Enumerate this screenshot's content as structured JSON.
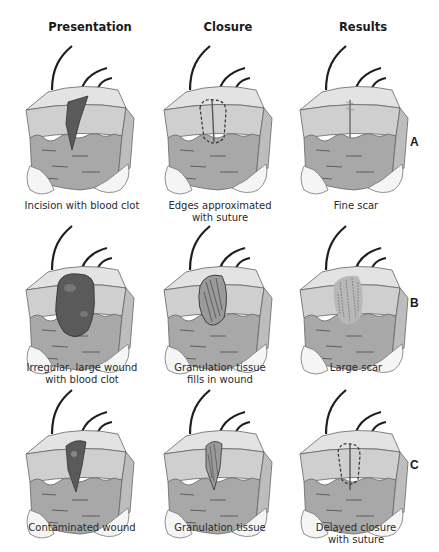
{
  "figure": {
    "columns": [
      {
        "label": "Presentation"
      },
      {
        "label": "Closure"
      },
      {
        "label": "Results"
      }
    ],
    "rows": [
      {
        "label": "A",
        "cells": [
          {
            "caption": "Incision with blood clot",
            "wound": "incision-clot"
          },
          {
            "caption": "Edges approximated\nwith suture",
            "wound": "sutured"
          },
          {
            "caption": "Fine scar",
            "wound": "fine-scar"
          }
        ]
      },
      {
        "label": "B",
        "cells": [
          {
            "caption": "Irregular, large wound\nwith blood clot",
            "wound": "large-clot"
          },
          {
            "caption": "Granulation tissue\nfills in wound",
            "wound": "granulation"
          },
          {
            "caption": "Large scar",
            "wound": "large-scar"
          }
        ]
      },
      {
        "label": "C",
        "cells": [
          {
            "caption": "Contaminated wound",
            "wound": "contaminated"
          },
          {
            "caption": "Granulation tissue",
            "wound": "granulation-narrow"
          },
          {
            "caption": "Delayed closure\nwith suture",
            "wound": "delayed-suture"
          }
        ]
      }
    ],
    "colors": {
      "skin_top": "#d9d9d9",
      "epidermis": "#c4c4c4",
      "dermis": "#a9a9a9",
      "fat": "#f2f2f2",
      "clot": "#5a5a5a",
      "outline": "#555555",
      "hair": "#1e1e1e"
    }
  }
}
